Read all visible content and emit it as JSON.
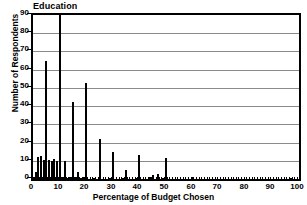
{
  "chart_data": {
    "type": "bar",
    "title": "Education",
    "xlabel": "Percentage of Budget Chosen",
    "ylabel": "Number of Respondents",
    "xlim": [
      0,
      100
    ],
    "ylim": [
      0,
      90
    ],
    "xticks": [
      0,
      10,
      20,
      30,
      40,
      50,
      60,
      70,
      80,
      90,
      100
    ],
    "yticks": [
      0,
      10,
      20,
      30,
      40,
      50,
      60,
      70,
      80,
      90
    ],
    "xtick_step_minor": 1,
    "grid": "horizontal",
    "legend": "none",
    "bar_color": "#000000",
    "note": "Bar at x=10 is clipped by the top of the axis (value exceeds 90).",
    "x": [
      0,
      1,
      2,
      3,
      4,
      5,
      6,
      7,
      8,
      9,
      10,
      11,
      12,
      13,
      14,
      15,
      16,
      17,
      18,
      19,
      20,
      21,
      22,
      23,
      24,
      25,
      26,
      27,
      28,
      29,
      30,
      31,
      32,
      33,
      34,
      35,
      36,
      37,
      38,
      39,
      40,
      41,
      42,
      43,
      44,
      45,
      46,
      47,
      48,
      49,
      50,
      55,
      60,
      65,
      70,
      75,
      80,
      85,
      90,
      95,
      97,
      100
    ],
    "values": [
      1,
      4,
      12,
      12.5,
      10.5,
      64.5,
      10.5,
      10,
      11,
      10,
      95,
      1,
      10,
      0.5,
      1,
      42.5,
      1,
      4,
      0.5,
      1,
      52.5,
      0,
      0,
      0.5,
      0,
      22,
      0,
      0,
      0,
      0.5,
      15,
      0,
      0,
      0,
      0.5,
      5,
      0,
      0,
      0,
      0.5,
      13,
      0,
      0,
      0,
      1,
      2,
      0,
      3,
      0,
      0.5,
      11.5,
      0,
      1,
      0,
      0,
      0,
      0,
      0,
      0,
      0,
      0.8,
      0
    ]
  },
  "axis": {
    "y_tick_labels": [
      "90",
      "80",
      "70",
      "60",
      "50",
      "40",
      "30",
      "20",
      "10",
      "0"
    ],
    "x_tick_labels": [
      "0",
      "10",
      "20",
      "30",
      "40",
      "50",
      "60",
      "70",
      "80",
      "90",
      "100"
    ]
  }
}
